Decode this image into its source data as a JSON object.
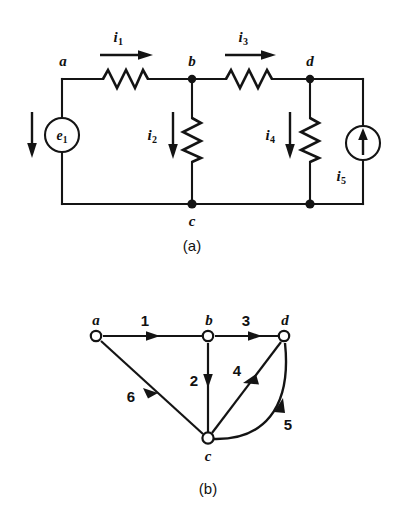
{
  "figure": {
    "background_color": "#ffffff",
    "ink_color": "#141414"
  },
  "panels": [
    {
      "id": "a",
      "caption": "(a)",
      "type": "circuit-schematic",
      "nodes": [
        "a",
        "b",
        "c",
        "d"
      ],
      "node_labels": {
        "a": "a",
        "b": "b",
        "c": "c",
        "d": "d"
      },
      "sources": [
        {
          "name": "voltage-source",
          "symbol": "e",
          "subscript": "1",
          "label": "e1",
          "shape": "circle",
          "position": "left-branch",
          "arrow_direction": "down"
        },
        {
          "name": "current-source",
          "symbol": "i",
          "subscript": "5",
          "label": "i5",
          "shape": "circle",
          "position": "right-branch",
          "arrow_direction": "up"
        }
      ],
      "currents": [
        {
          "symbol": "i",
          "subscript": "1",
          "label": "i1",
          "direction": "right",
          "branch": "a-b"
        },
        {
          "symbol": "i",
          "subscript": "2",
          "label": "i2",
          "direction": "down",
          "branch": "b-c"
        },
        {
          "symbol": "i",
          "subscript": "3",
          "label": "i3",
          "direction": "right",
          "branch": "b-d"
        },
        {
          "symbol": "i",
          "subscript": "4",
          "label": "i4",
          "direction": "down",
          "branch": "d-c"
        },
        {
          "symbol": "i",
          "subscript": "5",
          "label": "i5",
          "direction": "up",
          "branch": "c-d"
        }
      ],
      "resistors": [
        {
          "branch": "a-b",
          "orientation": "horizontal"
        },
        {
          "branch": "b-c",
          "orientation": "vertical"
        },
        {
          "branch": "b-d",
          "orientation": "horizontal"
        },
        {
          "branch": "d-c",
          "orientation": "vertical"
        }
      ]
    },
    {
      "id": "b",
      "caption": "(b)",
      "type": "oriented-graph",
      "nodes": [
        "a",
        "b",
        "c",
        "d"
      ],
      "node_labels": {
        "a": "a",
        "b": "b",
        "c": "c",
        "d": "d"
      },
      "edges": [
        {
          "label": "1",
          "from": "a",
          "to": "b",
          "shape": "straight"
        },
        {
          "label": "2",
          "from": "b",
          "to": "c",
          "shape": "straight"
        },
        {
          "label": "3",
          "from": "b",
          "to": "d",
          "shape": "straight"
        },
        {
          "label": "4",
          "from": "d",
          "to": "c",
          "shape": "straight"
        },
        {
          "label": "5",
          "from": "c",
          "to": "d",
          "shape": "curved"
        },
        {
          "label": "6",
          "from": "a",
          "to": "c",
          "shape": "straight"
        }
      ]
    }
  ],
  "labels": {
    "panel_a": {
      "node_a": "a",
      "node_b": "b",
      "node_c": "c",
      "node_d": "d",
      "i1": "i",
      "i1_sub": "1",
      "i2": "i",
      "i2_sub": "2",
      "i3": "i",
      "i3_sub": "3",
      "i4": "i",
      "i4_sub": "4",
      "i5": "i",
      "i5_sub": "5",
      "e1": "e",
      "e1_sub": "1",
      "caption": "(a)"
    },
    "panel_b": {
      "node_a": "a",
      "node_b": "b",
      "node_c": "c",
      "node_d": "d",
      "edge1": "1",
      "edge2": "2",
      "edge3": "3",
      "edge4": "4",
      "edge5": "5",
      "edge6": "6",
      "caption": "(b)"
    }
  }
}
